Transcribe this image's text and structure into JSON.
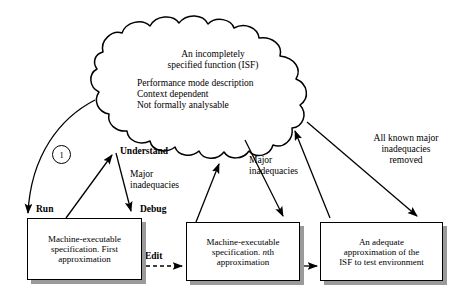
{
  "diagram": {
    "colors": {
      "stroke": "#000000",
      "background": "#ffffff",
      "shadow": "#9a9a9a"
    },
    "cloud": {
      "name": "isf-cloud",
      "title_line1": "An incompletely",
      "title_line2": "specified function (ISF)",
      "body_line1": "Performance mode description",
      "body_line2": "Context dependent",
      "body_line3": "Not formally analysable"
    },
    "boxes": [
      {
        "id": "box-first-approximation",
        "line1": "Machine-executable",
        "line2": "specification. First",
        "line3": "approximation"
      },
      {
        "id": "box-nth-approximation",
        "line1": "Machine-executable",
        "line2_pre": "specification. ",
        "line2_italic": "n",
        "line2_post": "th",
        "line3": "approximation"
      },
      {
        "id": "box-adequate-approximation",
        "line1": "An adequate",
        "line2": "approximation of the",
        "line3": "ISF to test environment"
      }
    ],
    "labels": {
      "marker_one": "1",
      "run": "Run",
      "understand": "Understand",
      "debug": "Debug",
      "edit": "Edit",
      "major_inadequacies_1_line1": "Major",
      "major_inadequacies_1_line2": "inadequacies",
      "major_inadequacies_2_line1": "Major",
      "major_inadequacies_2_line2": "inadequacies",
      "all_known_line1": "All known major",
      "all_known_line2": "inadequacies",
      "all_known_line3": "removed"
    }
  }
}
